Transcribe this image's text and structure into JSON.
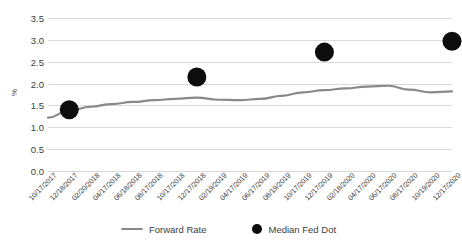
{
  "chart_data": {
    "type": "line",
    "title": "",
    "xlabel": "",
    "ylabel": "%",
    "ylim": [
      0.0,
      3.5
    ],
    "y_ticks": [
      "0.0",
      "0.5",
      "1.0",
      "1.5",
      "2.0",
      "2.5",
      "3.0",
      "3.5"
    ],
    "y_tick_values": [
      0.0,
      0.5,
      1.0,
      1.5,
      2.0,
      2.5,
      3.0,
      3.5
    ],
    "grid": true,
    "legend_position": "bottom",
    "categories": [
      "10/17/2017",
      "12/18/2017",
      "02/20/2018",
      "04/17/2018",
      "06/18/2018",
      "08/17/2018",
      "10/17/2018",
      "12/17/2018",
      "02/19/2019",
      "04/17/2019",
      "06/17/2019",
      "08/19/2019",
      "10/17/2019",
      "12/17/2019",
      "02/18/2020",
      "04/17/2020",
      "06/17/2020",
      "08/17/2020",
      "10/19/2020",
      "12/17/2020"
    ],
    "series": [
      {
        "name": "Forward Rate",
        "type": "line",
        "color": "#898989",
        "values": [
          1.22,
          1.38,
          1.47,
          1.53,
          1.58,
          1.62,
          1.65,
          1.68,
          1.63,
          1.62,
          1.65,
          1.72,
          1.8,
          1.85,
          1.89,
          1.93,
          1.95,
          1.86,
          1.8,
          1.82
        ]
      },
      {
        "name": "Median Fed Dot",
        "type": "scatter",
        "color": "#0d0d0d",
        "points": [
          {
            "x": "12/18/2017",
            "y": 1.4
          },
          {
            "x": "12/17/2018",
            "y": 2.15
          },
          {
            "x": "12/17/2019",
            "y": 2.72
          },
          {
            "x": "12/17/2020",
            "y": 2.97
          }
        ]
      }
    ]
  },
  "legend": {
    "items": [
      {
        "label": "Forward Rate",
        "marker": "line-swatch",
        "color": "#898989"
      },
      {
        "label": "Median Fed Dot",
        "marker": "circle-swatch",
        "color": "#0d0d0d"
      }
    ]
  },
  "axis": {
    "y_title": "%"
  }
}
